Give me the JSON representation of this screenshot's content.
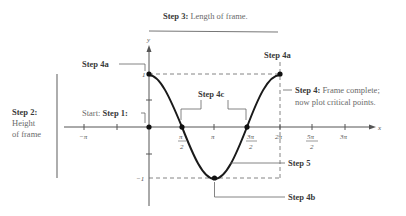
{
  "diagram": {
    "function": "y = cos x",
    "axes": {
      "x_label": "x",
      "y_label": "y",
      "x_ticks": [
        {
          "label": "−π",
          "frac": false
        },
        {
          "label": "π",
          "num": "π",
          "den": "2",
          "frac": true
        },
        {
          "label": "π",
          "frac": false
        },
        {
          "label": "3π/2",
          "num": "3π",
          "den": "2",
          "frac": true
        },
        {
          "label": "2π",
          "frac": false
        },
        {
          "label": "5π/2",
          "num": "5π",
          "den": "2",
          "frac": true
        },
        {
          "label": "3π",
          "frac": false
        }
      ],
      "y_ticks": [
        "1",
        "−1"
      ]
    },
    "labels": {
      "step3_bold": "Step 3:",
      "step3_text": " Length of frame.",
      "step2_bold": "Step 2:",
      "step2_line1": "Height",
      "step2_line2": "of frame",
      "step4a_left": "Step 4a",
      "step4a_right": "Step 4a",
      "start_prefix": "Start: ",
      "step1_bold": "Step 1:",
      "step4c": "Step 4c",
      "step4_bold": "Step 4:",
      "step4_line1": " Frame complete;",
      "step4_line2": "now plot critical points.",
      "step5": "Step 5",
      "step4b": "Step 4b"
    },
    "critical_points": [
      {
        "x": "0",
        "y": "1"
      },
      {
        "x": "π/2",
        "y": "0"
      },
      {
        "x": "π",
        "y": "−1"
      },
      {
        "x": "3π/2",
        "y": "0"
      },
      {
        "x": "2π",
        "y": "1"
      }
    ],
    "colors": {
      "curve": "#1a1a1a",
      "axis": "#555555",
      "frame": "#666666",
      "text": "#3a3a3a"
    }
  }
}
